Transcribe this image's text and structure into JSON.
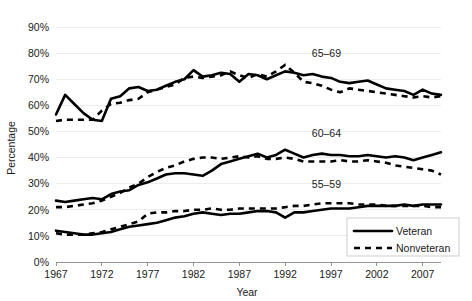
{
  "chart_data": {
    "type": "line",
    "title": "",
    "xlabel": "Year",
    "ylabel": "Percentage",
    "xlim": [
      1967,
      2009
    ],
    "ylim": [
      0,
      90
    ],
    "grid": true,
    "yticks": [
      "0%",
      "10%",
      "20%",
      "30%",
      "40%",
      "50%",
      "60%",
      "70%",
      "80%",
      "90%"
    ],
    "ytick_values": [
      0,
      10,
      20,
      30,
      40,
      50,
      60,
      70,
      80,
      90
    ],
    "xticks": [
      "1967",
      "1972",
      "1977",
      "1982",
      "1987",
      "1992",
      "1997",
      "2002",
      "2007"
    ],
    "xtick_values": [
      1967,
      1972,
      1977,
      1982,
      1987,
      1992,
      1997,
      2002,
      2007
    ],
    "legend_position": "bottom-right",
    "legend_entries": [
      {
        "name": "Veteran",
        "style": "solid"
      },
      {
        "name": "Nonveteran",
        "style": "dashed"
      }
    ],
    "group_annotations": [
      {
        "label": "65–69",
        "x": 1996.5,
        "y": 78.5
      },
      {
        "label": "60–64",
        "x": 1996.5,
        "y": 48.0
      },
      {
        "label": "55–59",
        "x": 1996.5,
        "y": 28.5
      }
    ],
    "x": [
      1967,
      1968,
      1969,
      1970,
      1971,
      1972,
      1973,
      1974,
      1975,
      1976,
      1977,
      1978,
      1979,
      1980,
      1981,
      1982,
      1983,
      1984,
      1985,
      1986,
      1987,
      1988,
      1989,
      1990,
      1991,
      1992,
      1993,
      1994,
      1995,
      1996,
      1997,
      1998,
      1999,
      2000,
      2001,
      2002,
      2003,
      2004,
      2005,
      2006,
      2007,
      2008,
      2009
    ],
    "series": [
      {
        "name": "65–69 Veteran",
        "group": "65–69",
        "style": "solid",
        "values": [
          56.5,
          64.0,
          60.5,
          57.0,
          54.5,
          54.0,
          62.5,
          63.5,
          66.5,
          67.0,
          65.5,
          66.0,
          67.5,
          69.0,
          70.0,
          73.5,
          71.0,
          71.5,
          72.5,
          72.0,
          69.0,
          72.0,
          71.5,
          70.0,
          71.5,
          73.0,
          72.5,
          71.5,
          72.0,
          71.0,
          70.5,
          69.0,
          68.5,
          69.0,
          69.5,
          68.0,
          66.5,
          66.0,
          65.5,
          64.0,
          66.0,
          64.5,
          64.0
        ]
      },
      {
        "name": "65–69 Nonveteran",
        "group": "65–69",
        "style": "dashed",
        "values": [
          54.0,
          54.5,
          54.5,
          54.5,
          54.5,
          58.0,
          60.5,
          61.0,
          62.0,
          62.5,
          65.0,
          66.0,
          67.0,
          68.0,
          70.5,
          71.0,
          70.5,
          71.0,
          71.5,
          73.0,
          71.5,
          70.5,
          72.0,
          71.0,
          73.0,
          75.5,
          72.5,
          69.0,
          68.5,
          67.5,
          66.0,
          65.0,
          66.5,
          66.0,
          65.5,
          65.0,
          64.5,
          64.0,
          63.5,
          63.0,
          63.5,
          63.0,
          63.5
        ]
      },
      {
        "name": "60–64 Veteran",
        "group": "60–64",
        "style": "solid",
        "values": [
          23.5,
          23.0,
          23.5,
          24.0,
          24.5,
          24.0,
          26.0,
          27.0,
          27.5,
          29.5,
          30.5,
          32.0,
          33.5,
          34.0,
          34.0,
          33.5,
          33.0,
          35.0,
          37.5,
          38.5,
          39.5,
          40.5,
          41.5,
          40.0,
          41.0,
          43.0,
          41.5,
          40.0,
          41.0,
          41.5,
          41.0,
          41.0,
          40.5,
          40.5,
          41.0,
          40.5,
          40.0,
          40.5,
          40.0,
          39.0,
          40.0,
          41.0,
          42.0
        ]
      },
      {
        "name": "60–64 Nonveteran",
        "group": "60–64",
        "style": "dashed",
        "values": [
          21.0,
          21.0,
          21.5,
          22.0,
          22.5,
          23.5,
          25.0,
          26.5,
          28.5,
          30.0,
          32.5,
          34.5,
          36.0,
          37.0,
          38.5,
          39.5,
          40.0,
          40.0,
          39.5,
          40.0,
          40.5,
          40.0,
          40.5,
          39.5,
          39.5,
          40.0,
          39.5,
          38.5,
          38.5,
          38.5,
          38.5,
          39.0,
          38.5,
          38.5,
          39.0,
          38.5,
          38.0,
          37.0,
          36.5,
          36.0,
          35.5,
          35.0,
          33.5
        ]
      },
      {
        "name": "55–59 Veteran",
        "group": "55–59",
        "style": "solid",
        "values": [
          12.0,
          11.5,
          11.0,
          10.5,
          10.5,
          11.0,
          11.5,
          12.5,
          13.5,
          14.0,
          14.5,
          15.0,
          16.0,
          17.0,
          17.5,
          18.5,
          19.0,
          18.5,
          18.0,
          18.5,
          18.5,
          19.0,
          19.5,
          19.5,
          19.0,
          17.0,
          19.0,
          19.0,
          19.5,
          20.0,
          20.5,
          20.5,
          20.5,
          21.0,
          21.5,
          21.5,
          21.5,
          21.5,
          22.0,
          21.5,
          22.0,
          22.0,
          22.0
        ]
      },
      {
        "name": "55–59 Nonveteran",
        "group": "55–59",
        "style": "dashed",
        "values": [
          11.0,
          10.5,
          10.5,
          10.5,
          11.0,
          11.5,
          12.5,
          13.5,
          14.5,
          15.5,
          18.5,
          19.0,
          19.0,
          19.5,
          19.5,
          20.0,
          20.0,
          20.5,
          20.0,
          20.0,
          20.5,
          20.5,
          20.5,
          20.5,
          20.5,
          21.0,
          21.5,
          21.5,
          22.0,
          22.5,
          22.5,
          22.5,
          22.5,
          22.0,
          22.0,
          22.0,
          21.5,
          21.5,
          21.5,
          21.5,
          21.5,
          21.0,
          21.0
        ]
      }
    ]
  }
}
